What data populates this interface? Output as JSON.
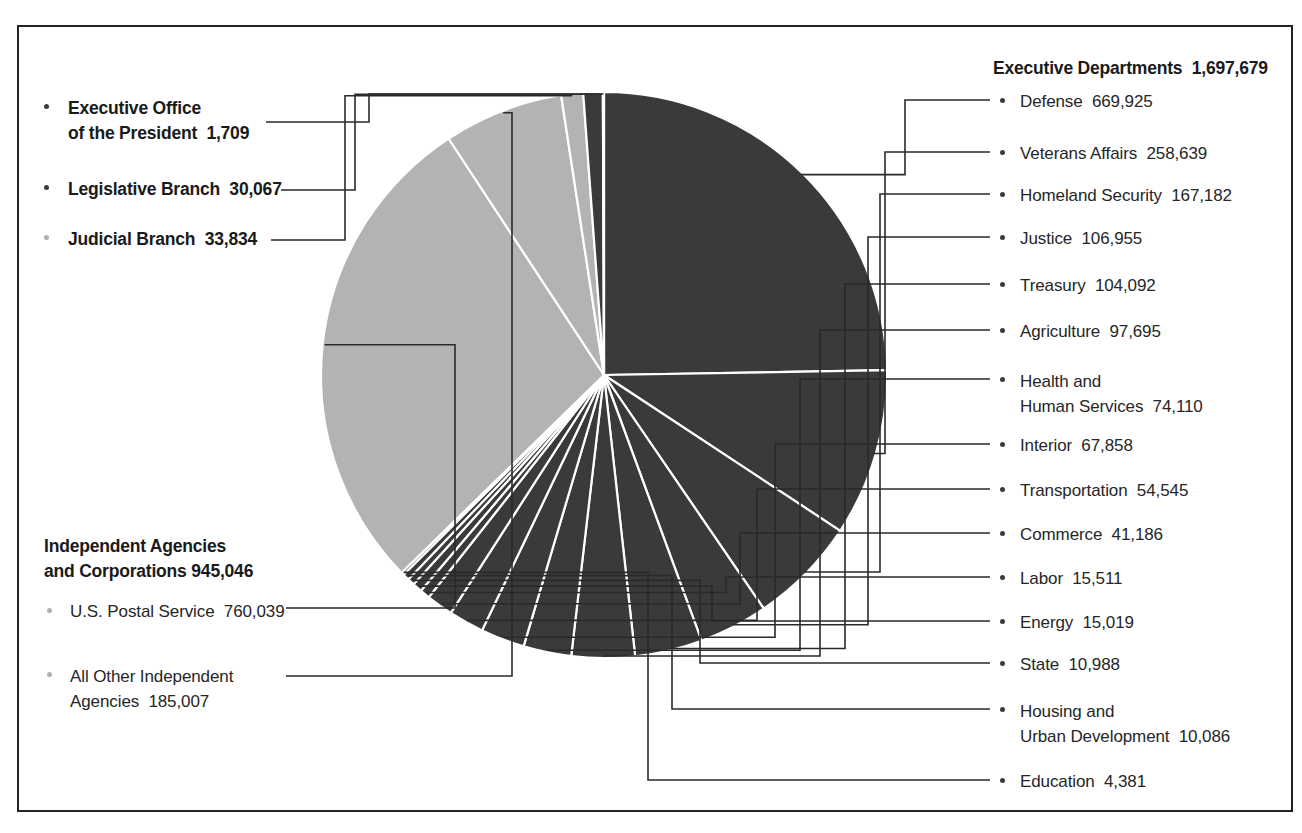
{
  "chart_data": {
    "type": "pie",
    "title": "",
    "units": "employees",
    "total": 2708335,
    "legend_position": "outside-left-and-right",
    "grid": false,
    "colors": {
      "dark": "#3a3a3a",
      "light": "#b3b3b3",
      "divider": "#ffffff",
      "leader": "#2a2a2a"
    },
    "groups": [
      {
        "name": "Executive Departments",
        "value": 1697679,
        "value_label": "1,697,679",
        "color": "#3a3a3a",
        "side": "right",
        "items": [
          {
            "label": "Defense",
            "value": 669925,
            "value_label": "669,925"
          },
          {
            "label": "Veterans Affairs",
            "value": 258639,
            "value_label": "258,639"
          },
          {
            "label": "Homeland Security",
            "value": 167182,
            "value_label": "167,182"
          },
          {
            "label": "Justice",
            "value": 106955,
            "value_label": "106,955"
          },
          {
            "label": "Treasury",
            "value": 104092,
            "value_label": "104,092"
          },
          {
            "label": "Agriculture",
            "value": 97695,
            "value_label": "97,695"
          },
          {
            "label": "Health and Human Services",
            "label_line1": "Health and",
            "label_line2": "Human Services",
            "value": 74110,
            "value_label": "74,110"
          },
          {
            "label": "Interior",
            "value": 67858,
            "value_label": "67,858"
          },
          {
            "label": "Transportation",
            "value": 54545,
            "value_label": "54,545"
          },
          {
            "label": "Commerce",
            "value": 41186,
            "value_label": "41,186"
          },
          {
            "label": "Labor",
            "value": 15511,
            "value_label": "15,511"
          },
          {
            "label": "Energy",
            "value": 15019,
            "value_label": "15,019"
          },
          {
            "label": "State",
            "value": 10988,
            "value_label": "10,988"
          },
          {
            "label": "Housing and Urban Development",
            "label_line1": "Housing and",
            "label_line2": "Urban Development",
            "value": 10086,
            "value_label": "10,086"
          },
          {
            "label": "Education",
            "value": 4381,
            "value_label": "4,381"
          }
        ]
      },
      {
        "name": "Independent Agencies and Corporations",
        "name_line1": "Independent Agencies",
        "name_line2": "and Corporations",
        "value": 945046,
        "value_label": "945,046",
        "color": "#b3b3b3",
        "side": "left",
        "items": [
          {
            "label": "U.S. Postal Service",
            "value": 760039,
            "value_label": "760,039"
          },
          {
            "label": "All Other Independent Agencies",
            "label_line1": "All Other Independent",
            "label_line2": "Agencies",
            "value": 185007,
            "value_label": "185,007"
          }
        ]
      },
      {
        "name": "Judicial Branch",
        "value": 33834,
        "value_label": "33,834",
        "color": "#b3b3b3",
        "side": "left",
        "items": []
      },
      {
        "name": "Legislative Branch",
        "value": 30067,
        "value_label": "30,067",
        "color": "#3a3a3a",
        "side": "left",
        "items": []
      },
      {
        "name": "Executive Office of the President",
        "name_line1": "Executive Office",
        "name_line2": "of the President",
        "value": 1709,
        "value_label": "1,709",
        "color": "#3a3a3a",
        "side": "left",
        "items": []
      }
    ]
  },
  "left": {
    "eop": {
      "line1": "Executive Office",
      "line2": "of the President",
      "value": "1,709"
    },
    "legislative": {
      "label": "Legislative Branch",
      "value": "30,067"
    },
    "judicial": {
      "label": "Judicial Branch",
      "value": "33,834"
    },
    "independent": {
      "head1": "Independent Agencies",
      "head2": "and Corporations",
      "head_value": "945,046",
      "usps": {
        "label": "U.S. Postal Service",
        "value": "760,039"
      },
      "other": {
        "line1": "All Other Independent",
        "line2": "Agencies",
        "value": "185,007"
      }
    }
  },
  "right": {
    "heading": "Executive Departments",
    "heading_value": "1,697,679",
    "items": [
      {
        "label": "Defense",
        "value": "669,925"
      },
      {
        "label": "Veterans Affairs",
        "value": "258,639"
      },
      {
        "label": "Homeland Security",
        "value": "167,182"
      },
      {
        "label": "Justice",
        "value": "106,955"
      },
      {
        "label": "Treasury",
        "value": "104,092"
      },
      {
        "label": "Agriculture",
        "value": "97,695"
      },
      {
        "label": "Health and",
        "label2": "Human Services",
        "value": "74,110"
      },
      {
        "label": "Interior",
        "value": "67,858"
      },
      {
        "label": "Transportation",
        "value": "54,545"
      },
      {
        "label": "Commerce",
        "value": "41,186"
      },
      {
        "label": "Labor",
        "value": "15,511"
      },
      {
        "label": "Energy",
        "value": "15,019"
      },
      {
        "label": "State",
        "value": "10,988"
      },
      {
        "label": "Housing and",
        "label2": "Urban Development",
        "value": "10,086"
      },
      {
        "label": "Education",
        "value": "4,381"
      }
    ]
  }
}
